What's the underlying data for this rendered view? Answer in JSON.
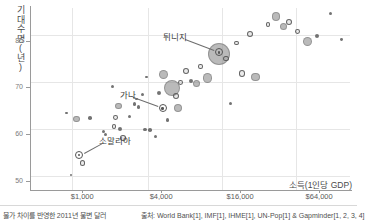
{
  "chart_data": {
    "type": "scatter",
    "title": "",
    "xlabel": "소득(1인당 GDP)",
    "ylabel": "기대수명(년)",
    "x_scale": "log",
    "xticks": [
      "$1,000",
      "$4,000",
      "$16,000",
      "$64,000"
    ],
    "xtick_values": [
      1000,
      4000,
      16000,
      64000
    ],
    "yticks": [
      "50",
      "60",
      "70",
      "80"
    ],
    "ytick_values": [
      50,
      60,
      70,
      80
    ],
    "ylim": [
      48,
      87
    ],
    "xlim": [
      400,
      110000
    ],
    "grid": true,
    "legend": "none",
    "bubble_encoding": "population",
    "color": "#8c8c8c",
    "annotations": [
      {
        "label": "튀니지",
        "x": 11000,
        "y": 77.5
      },
      {
        "label": "가나",
        "x": 4100,
        "y": 65.5
      },
      {
        "label": "소말리아",
        "x": 950,
        "y": 55.5
      }
    ],
    "points": [
      {
        "x": 820,
        "y": 51.2,
        "r": 1.2
      },
      {
        "x": 1000,
        "y": 53.8,
        "r": 2.6
      },
      {
        "x": 900,
        "y": 63.2,
        "r": 3.4
      },
      {
        "x": 1150,
        "y": 63.4,
        "r": 1.8
      },
      {
        "x": 760,
        "y": 64.5,
        "r": 1.2
      },
      {
        "x": 1450,
        "y": 60.6,
        "r": 1.6
      },
      {
        "x": 1500,
        "y": 60.0,
        "r": 1.5
      },
      {
        "x": 1750,
        "y": 61.6,
        "r": 2.2
      },
      {
        "x": 1800,
        "y": 63.6,
        "r": 2.4
      },
      {
        "x": 1950,
        "y": 61.0,
        "r": 2.0
      },
      {
        "x": 2050,
        "y": 59.2,
        "r": 2.8
      },
      {
        "x": 1900,
        "y": 66.0,
        "r": 3.4
      },
      {
        "x": 1700,
        "y": 70.2,
        "r": 1.6
      },
      {
        "x": 2300,
        "y": 63.8,
        "r": 1.6
      },
      {
        "x": 2500,
        "y": 66.4,
        "r": 1.8
      },
      {
        "x": 2700,
        "y": 65.8,
        "r": 1.7
      },
      {
        "x": 2600,
        "y": 67.5,
        "r": 1.4
      },
      {
        "x": 3000,
        "y": 61.0,
        "r": 1.8
      },
      {
        "x": 3300,
        "y": 60.8,
        "r": 1.8
      },
      {
        "x": 3100,
        "y": 72.2,
        "r": 1.4
      },
      {
        "x": 2900,
        "y": 68.4,
        "r": 1.5
      },
      {
        "x": 3600,
        "y": 59.4,
        "r": 1.6
      },
      {
        "x": 3850,
        "y": 68.8,
        "r": 2.0
      },
      {
        "x": 4200,
        "y": 72.8,
        "r": 4.5
      },
      {
        "x": 4500,
        "y": 63.0,
        "r": 1.6
      },
      {
        "x": 4800,
        "y": 69.8,
        "r": 8.0
      },
      {
        "x": 5200,
        "y": 68.2,
        "r": 3.2
      },
      {
        "x": 5400,
        "y": 65.6,
        "r": 4.0
      },
      {
        "x": 5600,
        "y": 71.0,
        "r": 2.4
      },
      {
        "x": 6200,
        "y": 73.5,
        "r": 3.0
      },
      {
        "x": 6800,
        "y": 71.4,
        "r": 2.0
      },
      {
        "x": 7400,
        "y": 70.8,
        "r": 3.6
      },
      {
        "x": 8000,
        "y": 74.5,
        "r": 2.2
      },
      {
        "x": 9000,
        "y": 72.0,
        "r": 4.6
      },
      {
        "x": 11000,
        "y": 77.2,
        "r": 11.0
      },
      {
        "x": 12500,
        "y": 76.2,
        "r": 2.6
      },
      {
        "x": 13500,
        "y": 66.6,
        "r": 1.7
      },
      {
        "x": 15000,
        "y": 79.5,
        "r": 2.4
      },
      {
        "x": 16500,
        "y": 73.0,
        "r": 3.2
      },
      {
        "x": 19000,
        "y": 81.4,
        "r": 3.0
      },
      {
        "x": 21000,
        "y": 72.2,
        "r": 4.2
      },
      {
        "x": 26000,
        "y": 83.5,
        "r": 2.2
      },
      {
        "x": 30000,
        "y": 85.2,
        "r": 4.2
      },
      {
        "x": 34000,
        "y": 83.0,
        "r": 3.6
      },
      {
        "x": 38000,
        "y": 84.0,
        "r": 3.0
      },
      {
        "x": 44000,
        "y": 82.0,
        "r": 2.4
      },
      {
        "x": 52000,
        "y": 79.8,
        "r": 4.6
      },
      {
        "x": 62000,
        "y": 81.0,
        "r": 2.0
      },
      {
        "x": 78000,
        "y": 85.8,
        "r": 1.6
      },
      {
        "x": 95000,
        "y": 80.2,
        "r": 1.4
      }
    ]
  },
  "footer": {
    "left_note": "물가 차이를 반영한 2011년 불변 달러",
    "source": "출처: World Bank[1], IMF[1], IHME[1], UN-Pop[1] & Gapminder[1, 2, 3, 4]"
  }
}
